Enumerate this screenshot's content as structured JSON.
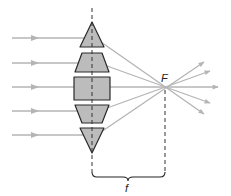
{
  "diagram": {
    "labels": {
      "focal_point": "F",
      "focal_length": "f"
    },
    "colors": {
      "prism_fill": "#bcbcbc",
      "prism_stroke": "#2a2a2a",
      "ray": "#b4b4b4",
      "dashed": "#333333"
    },
    "incoming_rays_y": [
      38,
      63,
      87,
      111,
      135
    ],
    "segments": [
      {
        "name": "top-triangle",
        "shape": "triangle"
      },
      {
        "name": "upper-trapezoid",
        "shape": "trapezoid"
      },
      {
        "name": "center-block",
        "shape": "rectangle"
      },
      {
        "name": "lower-trapezoid",
        "shape": "trapezoid"
      },
      {
        "name": "bottom-triangle",
        "shape": "triangle"
      }
    ]
  }
}
